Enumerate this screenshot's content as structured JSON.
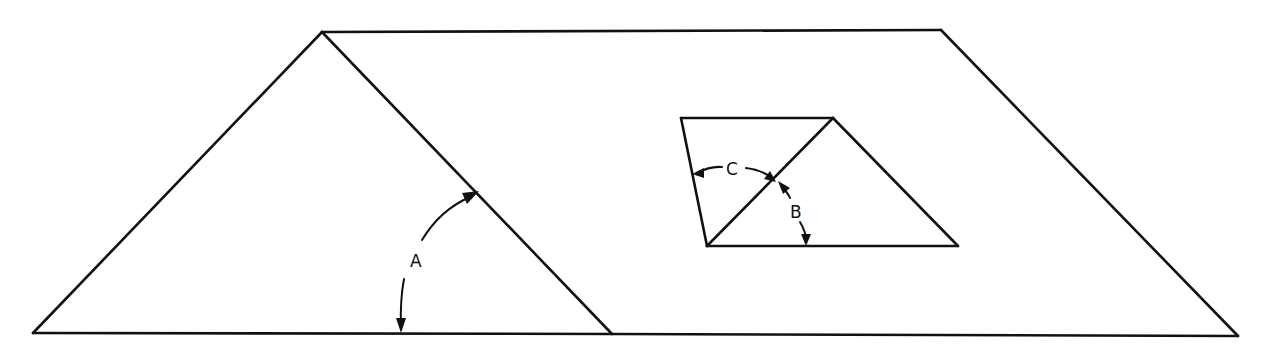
{
  "diagram": {
    "colors": {
      "line": "#111111",
      "background": "#ffffff"
    },
    "shapes": {
      "gable_triangle": {
        "points": [
          [
            33,
            333
          ],
          [
            322,
            32
          ],
          [
            612,
            334
          ]
        ]
      },
      "roof_plane": {
        "points": [
          [
            322,
            32
          ],
          [
            941,
            30
          ],
          [
            1238,
            336
          ],
          [
            612,
            334
          ]
        ]
      },
      "inset_quad": {
        "points": [
          [
            681,
            118
          ],
          [
            833,
            118
          ],
          [
            958,
            246
          ],
          [
            707,
            246
          ]
        ]
      },
      "inset_diagonal": {
        "from": [
          707,
          246
        ],
        "to": [
          833,
          118
        ]
      }
    },
    "angles": [
      {
        "id": "A",
        "label": "A",
        "label_pos": [
          418,
          265
        ]
      },
      {
        "id": "B",
        "label": "B",
        "label_pos": [
          797,
          217
        ]
      },
      {
        "id": "C",
        "label": "C",
        "label_pos": [
          733,
          174
        ]
      }
    ]
  }
}
